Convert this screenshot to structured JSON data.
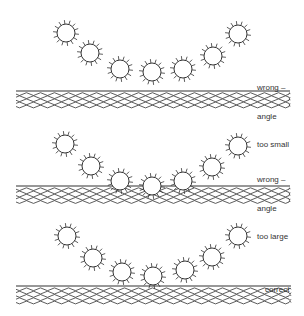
{
  "diagram": {
    "colors": {
      "stroke": "#333333",
      "background": "#ffffff"
    },
    "panels": [
      {
        "id": "too-small",
        "label_lines": [
          "wrong –",
          "angle",
          "too small"
        ],
        "label_pos": [
          257,
          64
        ],
        "water": {
          "x1": 16,
          "x2": 290,
          "top": 91,
          "lines": 6,
          "spacing": 3.1
        },
        "particles": [
          [
            66,
            33
          ],
          [
            90,
            53
          ],
          [
            120,
            69
          ],
          [
            152,
            72
          ],
          [
            183,
            69
          ],
          [
            213,
            56
          ],
          [
            238,
            34
          ]
        ]
      },
      {
        "id": "too-large",
        "label_lines": [
          "wrong –",
          "angle",
          "too large"
        ],
        "label_pos": [
          257,
          156
        ],
        "water": {
          "x1": 16,
          "x2": 290,
          "top": 186,
          "lines": 6,
          "spacing": 3.2
        },
        "particles": [
          [
            65,
            144
          ],
          [
            91,
            166
          ],
          [
            120,
            181
          ],
          [
            152,
            186
          ],
          [
            183,
            181
          ],
          [
            212,
            167
          ],
          [
            238,
            146
          ]
        ]
      },
      {
        "id": "correct",
        "label_lines": [
          "correct"
        ],
        "label_pos": [
          265,
          266
        ],
        "water": {
          "x1": 16,
          "x2": 291,
          "top": 286,
          "lines": 6,
          "spacing": 3.3
        },
        "particles": [
          [
            67,
            236
          ],
          [
            93,
            258
          ],
          [
            122,
            272
          ],
          [
            153,
            276
          ],
          [
            185,
            270
          ],
          [
            212,
            257
          ],
          [
            238,
            236
          ]
        ]
      }
    ],
    "particle_radius": 9,
    "spike_count": 14,
    "spike_length": 4
  }
}
